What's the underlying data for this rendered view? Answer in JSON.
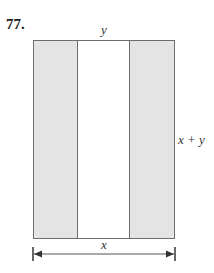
{
  "problem": {
    "number": "77."
  },
  "figure": {
    "labels": {
      "top": "y",
      "right": "x + y",
      "bottom": "x"
    },
    "regions": [
      {
        "name": "left-shaded-strip",
        "shaded": true
      },
      {
        "name": "middle-white-strip",
        "shaded": false
      },
      {
        "name": "right-shaded-strip",
        "shaded": true
      }
    ],
    "colors": {
      "shade": "#e4e4e4",
      "stroke": "#6d6d6d",
      "arrow": "#333333"
    }
  }
}
